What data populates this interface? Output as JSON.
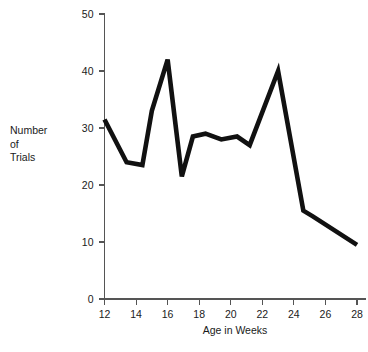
{
  "chart_data": {
    "type": "line",
    "title": "",
    "xlabel": "Age in Weeks",
    "ylabel": "Number of Trials",
    "ylabel_lines": [
      "Number",
      "of",
      "Trials"
    ],
    "xlim": [
      12,
      28.5
    ],
    "ylim": [
      0,
      50
    ],
    "xticks": [
      12,
      14,
      16,
      18,
      20,
      22,
      24,
      26,
      28
    ],
    "yticks": [
      0,
      10,
      20,
      30,
      40,
      50
    ],
    "xtick_labels": [
      "12",
      "14",
      "16",
      "18",
      "20",
      "22",
      "24",
      "26",
      "28"
    ],
    "ytick_labels": [
      "0",
      "10",
      "20",
      "30",
      "40",
      "50"
    ],
    "grid": false,
    "legend": false,
    "series": [
      {
        "name": "Number of Trials",
        "color": "#111111",
        "x": [
          12.0,
          13.4,
          14.4,
          15.0,
          16.0,
          16.9,
          17.6,
          18.4,
          19.4,
          20.4,
          21.2,
          23.0,
          24.6,
          25.2,
          28.0
        ],
        "y": [
          31.5,
          24.0,
          23.5,
          33.0,
          42.0,
          21.5,
          28.5,
          29.0,
          28.0,
          28.5,
          27.0,
          40.0,
          15.5,
          14.5,
          9.5
        ]
      }
    ]
  },
  "axis": {
    "y_axis_name": "y-axis",
    "x_axis_name": "x-axis"
  }
}
